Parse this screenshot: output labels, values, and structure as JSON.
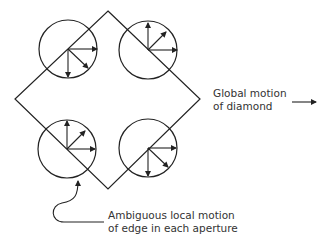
{
  "labels": {
    "global_line1": "Global motion",
    "global_line2": "of diamond",
    "local_line1": "Ambiguous local motion",
    "local_line2": "of edge in each aperture"
  },
  "diagram": {
    "shape": "diamond",
    "apertures": [
      {
        "position": "top-left",
        "arrows": [
          "right",
          "down",
          "down-right"
        ]
      },
      {
        "position": "top-right",
        "arrows": [
          "up",
          "up-right",
          "right"
        ]
      },
      {
        "position": "bottom-left",
        "arrows": [
          "up",
          "up-right",
          "right"
        ]
      },
      {
        "position": "bottom-right",
        "arrows": [
          "right",
          "down",
          "down-right"
        ]
      }
    ],
    "stroke_color": "#222222"
  }
}
